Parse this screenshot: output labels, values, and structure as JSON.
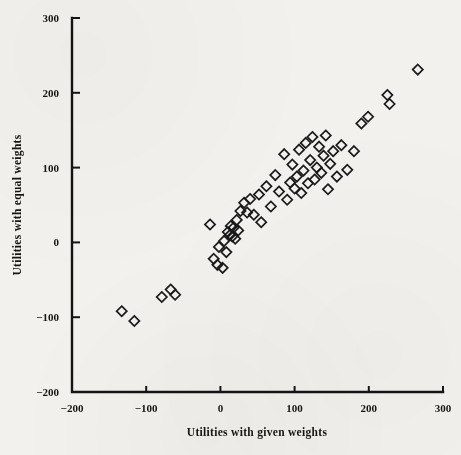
{
  "chart_data": {
    "type": "scatter",
    "title": "",
    "xlabel": "Utilities with given weights",
    "ylabel": "Utilities with equal weights",
    "xlim": [
      -200,
      300
    ],
    "ylim": [
      -200,
      300
    ],
    "xticks": [
      -200,
      -100,
      0,
      100,
      200,
      300
    ],
    "yticks": [
      -200,
      -100,
      0,
      100,
      200,
      300
    ],
    "xticklabels": [
      "−200",
      "−100",
      "0",
      "100",
      "200",
      "300"
    ],
    "yticklabels": [
      "−200",
      "−100",
      "0",
      "100",
      "200",
      "300"
    ],
    "grid": false,
    "legend": null,
    "marker": "open-diamond",
    "marker_color": "#1a1a1a",
    "n_points": 62,
    "points": [
      [
        -133,
        -92
      ],
      [
        -116,
        -105
      ],
      [
        -79,
        -73
      ],
      [
        -67,
        -63
      ],
      [
        -61,
        -70
      ],
      [
        -14,
        24
      ],
      [
        -9,
        -22
      ],
      [
        -4,
        -30
      ],
      [
        -2,
        -6
      ],
      [
        3,
        -34
      ],
      [
        5,
        2
      ],
      [
        8,
        -13
      ],
      [
        10,
        14
      ],
      [
        13,
        10
      ],
      [
        14,
        22
      ],
      [
        16,
        8
      ],
      [
        18,
        20
      ],
      [
        20,
        5
      ],
      [
        22,
        30
      ],
      [
        24,
        16
      ],
      [
        27,
        42
      ],
      [
        32,
        53
      ],
      [
        36,
        40
      ],
      [
        40,
        58
      ],
      [
        45,
        37
      ],
      [
        52,
        64
      ],
      [
        55,
        27
      ],
      [
        62,
        75
      ],
      [
        68,
        48
      ],
      [
        74,
        90
      ],
      [
        79,
        68
      ],
      [
        86,
        118
      ],
      [
        90,
        57
      ],
      [
        94,
        80
      ],
      [
        97,
        104
      ],
      [
        100,
        72
      ],
      [
        103,
        88
      ],
      [
        106,
        124
      ],
      [
        109,
        66
      ],
      [
        112,
        96
      ],
      [
        115,
        133
      ],
      [
        118,
        79
      ],
      [
        121,
        110
      ],
      [
        124,
        141
      ],
      [
        127,
        84
      ],
      [
        130,
        100
      ],
      [
        133,
        128
      ],
      [
        136,
        93
      ],
      [
        139,
        116
      ],
      [
        142,
        143
      ],
      [
        145,
        71
      ],
      [
        148,
        105
      ],
      [
        152,
        122
      ],
      [
        157,
        88
      ],
      [
        163,
        130
      ],
      [
        171,
        97
      ],
      [
        180,
        122
      ],
      [
        190,
        159
      ],
      [
        199,
        168
      ],
      [
        225,
        197
      ],
      [
        228,
        185
      ],
      [
        266,
        231
      ]
    ]
  },
  "figure": {
    "background": "#f2f1ee",
    "axis_color": "#141414",
    "marker_color": "#1a1a1a"
  }
}
